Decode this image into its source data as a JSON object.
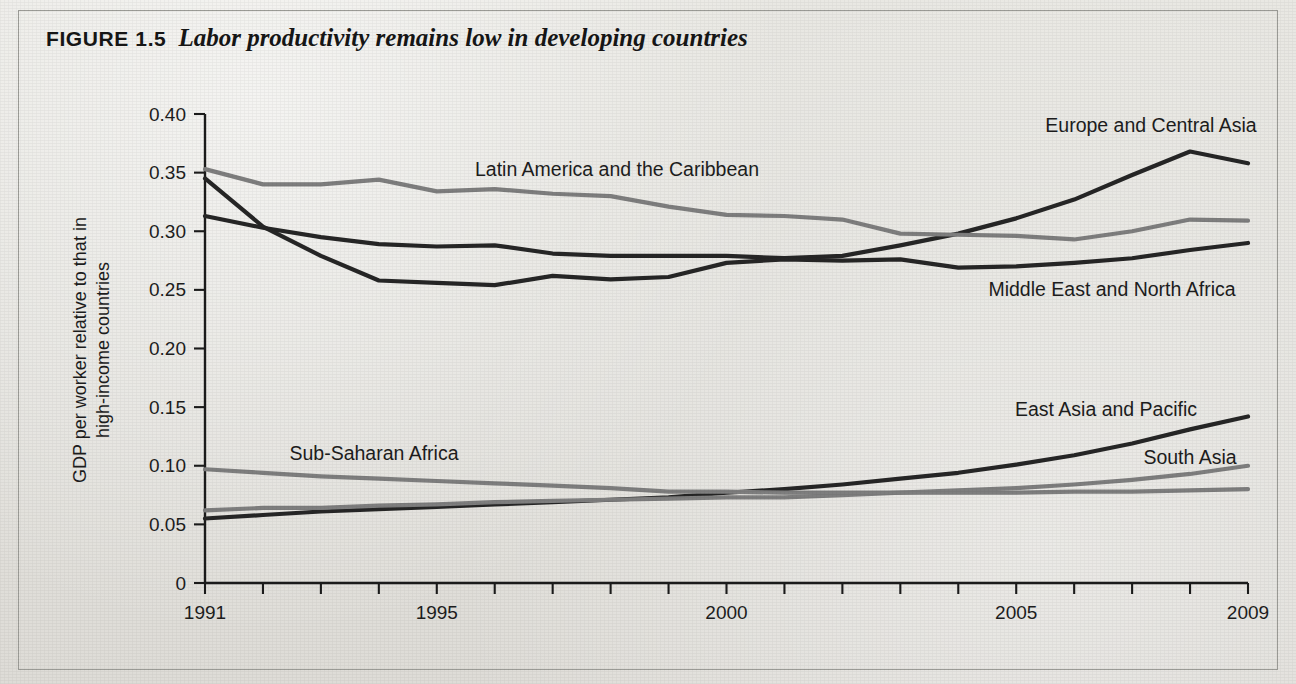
{
  "figure": {
    "number_label": "FIGURE 1.5",
    "caption": "Labor productivity remains low in developing countries"
  },
  "chart_data": {
    "type": "line",
    "title": "Labor productivity remains low in developing countries",
    "xlabel": "",
    "ylabel": "GDP per worker relative to that in high-income countries",
    "ylabel_line1": "GDP per worker relative to that in",
    "ylabel_line2": "high-income countries",
    "xlim": [
      1991,
      2009
    ],
    "ylim": [
      0,
      0.4
    ],
    "grid": false,
    "legend_position": "inline-labels",
    "y_ticks": [
      "0",
      "0.05",
      "0.10",
      "0.15",
      "0.20",
      "0.25",
      "0.30",
      "0.35",
      "0.40"
    ],
    "y_tick_values": [
      0,
      0.05,
      0.1,
      0.15,
      0.2,
      0.25,
      0.3,
      0.35,
      0.4
    ],
    "x_ticks_labeled": [
      "1991",
      "1995",
      "2000",
      "2005",
      "2009"
    ],
    "x_tick_values": [
      1991,
      1992,
      1993,
      1994,
      1995,
      1996,
      1997,
      1998,
      1999,
      2000,
      2001,
      2002,
      2003,
      2004,
      2005,
      2006,
      2007,
      2008,
      2009
    ],
    "x": [
      1991,
      1992,
      1993,
      1994,
      1995,
      1996,
      1997,
      1998,
      1999,
      2000,
      2001,
      2002,
      2003,
      2004,
      2005,
      2006,
      2007,
      2008,
      2009
    ],
    "series": [
      {
        "name": "Europe and Central Asia",
        "color": "#262626",
        "label_x": 1151,
        "label_y": 132,
        "label_anchor": "middle",
        "values": [
          0.313,
          0.303,
          0.295,
          0.289,
          0.287,
          0.288,
          0.281,
          0.279,
          0.279,
          0.279,
          0.277,
          0.279,
          0.288,
          0.298,
          0.311,
          0.327,
          0.348,
          0.368,
          0.358
        ]
      },
      {
        "name": "Latin America and the Caribbean",
        "color": "#7e7e7e",
        "label_x": 617,
        "label_y": 176,
        "label_anchor": "middle",
        "values": [
          0.353,
          0.34,
          0.34,
          0.344,
          0.334,
          0.336,
          0.332,
          0.33,
          0.321,
          0.314,
          0.313,
          0.31,
          0.298,
          0.297,
          0.296,
          0.293,
          0.3,
          0.31,
          0.309
        ]
      },
      {
        "name": "Middle East and North Africa",
        "color": "#262626",
        "label_x": 1112,
        "label_y": 296,
        "label_anchor": "middle",
        "values": [
          0.345,
          0.304,
          0.279,
          0.258,
          0.256,
          0.254,
          0.262,
          0.259,
          0.261,
          0.273,
          0.276,
          0.275,
          0.276,
          0.269,
          0.27,
          0.273,
          0.277,
          0.284,
          0.29
        ]
      },
      {
        "name": "East Asia and Pacific",
        "color": "#262626",
        "label_x": 1106,
        "label_y": 416,
        "label_anchor": "middle",
        "values": [
          0.055,
          0.058,
          0.061,
          0.063,
          0.065,
          0.067,
          0.069,
          0.071,
          0.073,
          0.077,
          0.08,
          0.084,
          0.089,
          0.094,
          0.101,
          0.109,
          0.119,
          0.131,
          0.142
        ]
      },
      {
        "name": "South Asia",
        "color": "#7e7e7e",
        "label_x": 1190,
        "label_y": 464,
        "label_anchor": "middle",
        "values": [
          0.062,
          0.064,
          0.064,
          0.066,
          0.067,
          0.069,
          0.07,
          0.071,
          0.072,
          0.073,
          0.073,
          0.075,
          0.077,
          0.079,
          0.081,
          0.084,
          0.088,
          0.093,
          0.1
        ]
      },
      {
        "name": "Sub-Saharan Africa",
        "color": "#7e7e7e",
        "label_x": 374,
        "label_y": 460,
        "label_anchor": "middle",
        "values": [
          0.097,
          0.094,
          0.091,
          0.089,
          0.087,
          0.085,
          0.083,
          0.081,
          0.078,
          0.078,
          0.077,
          0.077,
          0.077,
          0.077,
          0.077,
          0.078,
          0.078,
          0.079,
          0.08
        ]
      }
    ]
  }
}
